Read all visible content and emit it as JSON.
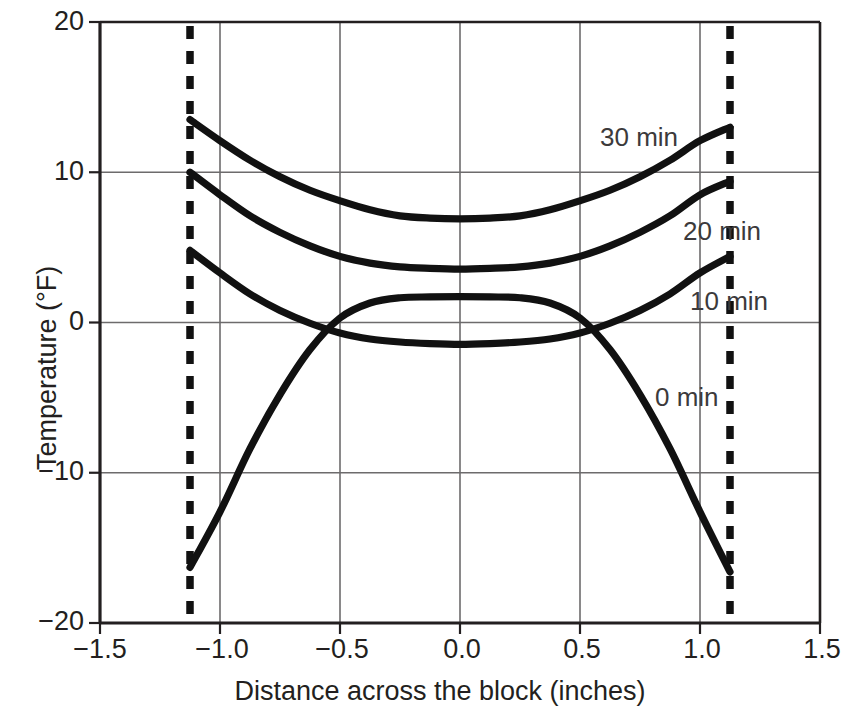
{
  "chart_data": {
    "type": "line",
    "title": "",
    "xlabel": "Distance across the block (inches)",
    "ylabel": "Temperature (°F)",
    "xlim": [
      -1.5,
      1.5
    ],
    "ylim": [
      -20,
      20
    ],
    "xticks": [
      "−1.5",
      "−1.0",
      "−0.5",
      "0.0",
      "0.5",
      "1.0",
      "1.5"
    ],
    "xtick_values": [
      -1.5,
      -1.0,
      -0.5,
      0.0,
      0.5,
      1.0,
      1.5
    ],
    "yticks": [
      "20",
      "10",
      "0",
      "−10",
      "−20"
    ],
    "ytick_values": [
      20,
      10,
      0,
      -10,
      -20
    ],
    "grid": true,
    "legend": "inline curve labels",
    "annotations": [
      {
        "text": "30 min",
        "x": 0.58,
        "y": 13.2
      },
      {
        "text": "20 min",
        "x": 0.92,
        "y": 5.6
      },
      {
        "text": "10 min",
        "x": 0.88,
        "y": 0.6
      },
      {
        "text": "0 min",
        "x": 0.8,
        "y": -6.2
      }
    ],
    "boundary_lines": {
      "style": "dashed",
      "x_values": [
        -1.125,
        1.125
      ],
      "color": "#111111"
    },
    "series": [
      {
        "name": "30 min",
        "x": [
          -1.125,
          -1.0,
          -0.875,
          -0.75,
          -0.625,
          -0.5,
          -0.375,
          -0.25,
          -0.125,
          0.0,
          0.125,
          0.25,
          0.375,
          0.5,
          0.625,
          0.75,
          0.875,
          1.0,
          1.125
        ],
        "values": [
          13.5,
          12.1,
          10.8,
          9.7,
          8.8,
          8.1,
          7.5,
          7.1,
          6.95,
          6.9,
          6.95,
          7.1,
          7.5,
          8.1,
          8.8,
          9.7,
          10.8,
          12.1,
          13.0
        ]
      },
      {
        "name": "20 min",
        "x": [
          -1.125,
          -1.0,
          -0.875,
          -0.75,
          -0.625,
          -0.5,
          -0.375,
          -0.25,
          -0.125,
          0.0,
          0.125,
          0.25,
          0.375,
          0.5,
          0.625,
          0.75,
          0.875,
          1.0,
          1.125
        ],
        "values": [
          10.0,
          8.5,
          7.1,
          6.0,
          5.1,
          4.4,
          3.95,
          3.7,
          3.6,
          3.55,
          3.6,
          3.7,
          3.95,
          4.4,
          5.1,
          6.0,
          7.1,
          8.5,
          9.4
        ]
      },
      {
        "name": "10 min",
        "x": [
          -1.125,
          -1.0,
          -0.875,
          -0.75,
          -0.625,
          -0.5,
          -0.375,
          -0.25,
          -0.125,
          0.0,
          0.125,
          0.25,
          0.375,
          0.5,
          0.625,
          0.75,
          0.875,
          1.0,
          1.125
        ],
        "values": [
          4.8,
          3.3,
          1.9,
          0.8,
          -0.05,
          -0.7,
          -1.1,
          -1.3,
          -1.4,
          -1.45,
          -1.4,
          -1.3,
          -1.1,
          -0.7,
          -0.05,
          0.8,
          1.9,
          3.3,
          4.4
        ]
      },
      {
        "name": "0 min",
        "x": [
          -1.125,
          -1.0,
          -0.875,
          -0.75,
          -0.625,
          -0.5,
          -0.375,
          -0.25,
          -0.125,
          0.0,
          0.125,
          0.25,
          0.375,
          0.5,
          0.625,
          0.75,
          0.875,
          1.0,
          1.125
        ],
        "values": [
          -16.3,
          -12.6,
          -8.4,
          -4.8,
          -1.8,
          0.3,
          1.3,
          1.65,
          1.7,
          1.72,
          1.7,
          1.65,
          1.3,
          0.3,
          -1.8,
          -4.8,
          -8.4,
          -12.6,
          -16.6
        ]
      }
    ]
  },
  "axes": {
    "y_label": "Temperature (°F)",
    "x_label": "Distance across the block (inches)",
    "y_ticks": [
      "20",
      "10",
      "0",
      "−10",
      "−20"
    ],
    "x_ticks": [
      "−1.5",
      "−1.0",
      "−0.5",
      "0.0",
      "0.5",
      "1.0",
      "1.5"
    ]
  },
  "curve_labels": {
    "t30": "30 min",
    "t20": "20 min",
    "t10": "10 min",
    "t0": "0 min"
  },
  "colors": {
    "curve": "#111111",
    "grid": "#6d6b6c",
    "axis": "#231f20",
    "text": "#231f20",
    "label_text": "#3c3a3b"
  }
}
